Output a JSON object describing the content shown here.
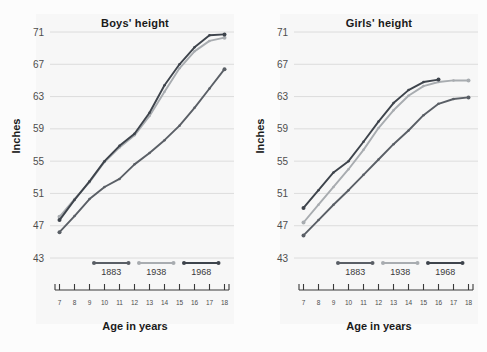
{
  "figure": {
    "background_color": "#fcfcfc",
    "panel_background_color": "#f7f7f7",
    "gridline_color": "#d5d5d5",
    "axis_color": "#3a3a3a"
  },
  "axis": {
    "ylabel": "Inches",
    "xlabel": "Age in years",
    "ylim": [
      43,
      71
    ],
    "yticks": [
      43,
      47,
      51,
      55,
      59,
      63,
      67,
      71
    ],
    "ytick_labels": [
      "43",
      "47",
      "51",
      "55",
      "59",
      "63",
      "67",
      "71"
    ],
    "xlim": [
      6.5,
      18.5
    ],
    "xticks": [
      7,
      8,
      9,
      10,
      11,
      12,
      13,
      14,
      15,
      16,
      17,
      18
    ],
    "xtick_labels": [
      "7",
      "8",
      "9",
      "10",
      "11",
      "12",
      "13",
      "14",
      "15",
      "16",
      "17",
      "18"
    ],
    "grid": "horizontal"
  },
  "legend": {
    "position": "bottom-inside",
    "entries": [
      {
        "label": "1883",
        "color": "#5a5f66"
      },
      {
        "label": "1938",
        "color": "#a8acb0"
      },
      {
        "label": "1968",
        "color": "#3e444c"
      }
    ]
  },
  "chart_data": [
    {
      "type": "line",
      "title": "Boys' height",
      "xlabel": "Age in years",
      "ylabel": "Inches",
      "xlim": [
        6.5,
        18.5
      ],
      "ylim": [
        43,
        71
      ],
      "x": [
        7,
        8,
        9,
        10,
        11,
        12,
        13,
        14,
        15,
        16,
        17,
        18
      ],
      "grid": "horizontal",
      "legend": "inside bottom",
      "series": [
        {
          "name": "1883",
          "color": "#5a5f66",
          "x": [
            7,
            8,
            9,
            10,
            11,
            12,
            13,
            14,
            15,
            16,
            17,
            18
          ],
          "values": [
            46.2,
            48.2,
            50.3,
            51.8,
            52.8,
            54.6,
            56.0,
            57.6,
            59.4,
            61.6,
            64.0,
            66.4
          ]
        },
        {
          "name": "1938",
          "color": "#a8acb0",
          "x": [
            7,
            8,
            9,
            10,
            11,
            12,
            13,
            14,
            15,
            16,
            17,
            18
          ],
          "values": [
            48.1,
            50.3,
            52.4,
            54.9,
            56.7,
            58.2,
            60.6,
            63.6,
            66.5,
            68.6,
            69.9,
            70.3
          ]
        },
        {
          "name": "1968",
          "color": "#3e444c",
          "x": [
            7,
            8,
            9,
            10,
            11,
            12,
            13,
            14,
            15,
            16,
            17,
            18
          ],
          "values": [
            47.7,
            50.2,
            52.5,
            55.0,
            56.9,
            58.4,
            61.0,
            64.4,
            67.0,
            69.1,
            70.6,
            70.7
          ]
        }
      ]
    },
    {
      "type": "line",
      "title": "Girls' height",
      "xlabel": "Age in years",
      "ylabel": "Inches",
      "xlim": [
        6.5,
        18.5
      ],
      "ylim": [
        43,
        71
      ],
      "x": [
        7,
        8,
        9,
        10,
        11,
        12,
        13,
        14,
        15,
        16,
        17,
        18
      ],
      "grid": "horizontal",
      "legend": "inside bottom",
      "series": [
        {
          "name": "1883",
          "color": "#5a5f66",
          "x": [
            7,
            8,
            9,
            10,
            11,
            12,
            13,
            14,
            15,
            16,
            17,
            18
          ],
          "values": [
            45.8,
            47.7,
            49.6,
            51.4,
            53.3,
            55.2,
            57.1,
            58.8,
            60.7,
            62.1,
            62.7,
            62.9
          ]
        },
        {
          "name": "1938",
          "color": "#a8acb0",
          "x": [
            7,
            8,
            9,
            10,
            11,
            12,
            13,
            14,
            15,
            16,
            17,
            18
          ],
          "values": [
            47.4,
            49.6,
            51.8,
            54.0,
            56.4,
            59.1,
            61.3,
            63.1,
            64.3,
            64.8,
            65.0,
            65.0
          ]
        },
        {
          "name": "1968",
          "color": "#3e444c",
          "x": [
            7,
            8,
            9,
            10,
            11,
            12,
            13,
            14,
            15,
            16
          ],
          "values": [
            49.2,
            51.4,
            53.6,
            55.0,
            57.4,
            59.9,
            62.2,
            63.8,
            64.8,
            65.1
          ]
        }
      ]
    }
  ]
}
